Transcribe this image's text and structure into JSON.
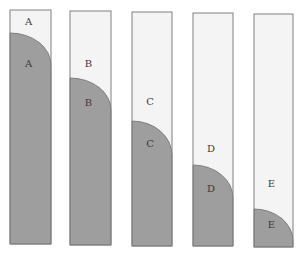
{
  "diagram": {
    "title": "",
    "background": "#ffffff",
    "colors": {
      "empty": "#f4f4f4",
      "filled": "#9e9e9e",
      "border": "#808080",
      "label": "#3a3a3a"
    },
    "columns": [
      {
        "id": "A",
        "upper_label": "A",
        "lower_label": "A",
        "x": 10,
        "w": 41,
        "top": 10,
        "bottom": 244,
        "fill_top": 33,
        "curve_end": 65,
        "upper_label_y": 25,
        "lower_label_y": 67
      },
      {
        "id": "B",
        "upper_label": "B",
        "lower_label": "B",
        "x": 70,
        "w": 41,
        "top": 11,
        "bottom": 245,
        "fill_top": 78,
        "curve_end": 110,
        "upper_label_y": 67,
        "lower_label_y": 106
      },
      {
        "id": "C",
        "upper_label": "C",
        "lower_label": "C",
        "x": 132,
        "w": 40,
        "top": 12,
        "bottom": 246,
        "fill_top": 121,
        "curve_end": 155,
        "upper_label_y": 105,
        "lower_label_y": 147
      },
      {
        "id": "D",
        "upper_label": "D",
        "lower_label": "D",
        "x": 193,
        "w": 40,
        "top": 13,
        "bottom": 246,
        "fill_top": 165,
        "curve_end": 198,
        "upper_label_y": 152,
        "lower_label_y": 192
      },
      {
        "id": "E",
        "upper_label": "E",
        "lower_label": "E",
        "x": 254,
        "w": 39,
        "top": 14,
        "bottom": 247,
        "fill_top": 209,
        "curve_end": 241,
        "upper_label_y": 187,
        "lower_label_y": 228
      }
    ]
  }
}
